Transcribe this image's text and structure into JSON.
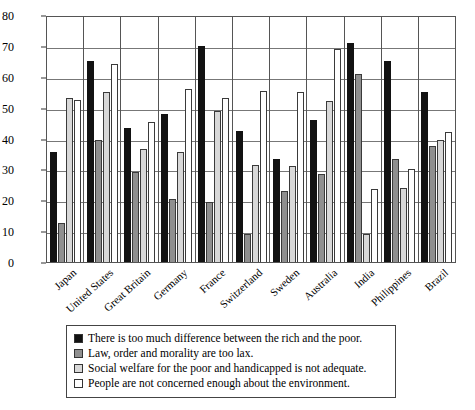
{
  "chart_data": {
    "type": "bar",
    "title": "",
    "subtitle": "",
    "xlabel": "",
    "ylabel": "",
    "ylim": [
      0,
      80
    ],
    "yticks": [
      0,
      10,
      20,
      30,
      40,
      50,
      60,
      70,
      80
    ],
    "grid": true,
    "legend_position": "below-plot",
    "categories": [
      "Japan",
      "United States",
      "Great Britain",
      "Germany",
      "France",
      "Switzerland",
      "Sweden",
      "Australia",
      "India",
      "Philippines",
      "Brazil"
    ],
    "series": [
      {
        "name": "There is too much difference between the rich and the poor.",
        "color": "#121212",
        "values": [
          35.5,
          65,
          43.5,
          48,
          70,
          42.5,
          33.5,
          46,
          71,
          65,
          55
        ]
      },
      {
        "name": "Law, order and morality are too lax.",
        "color": "#8f8f8f",
        "values": [
          12.5,
          39.5,
          29,
          20.5,
          19.5,
          9,
          23,
          28.5,
          61,
          33.5,
          37.5
        ]
      },
      {
        "name": "Social welfare for the poor and handicapped is not adequate.",
        "color": "#d8d8d8",
        "values": [
          53,
          55,
          36.5,
          35.5,
          49,
          31.5,
          31,
          52,
          9,
          24,
          39.5
        ]
      },
      {
        "name": "People are not concerned enough about the environment.",
        "color": "#ffffff",
        "values": [
          52.5,
          64,
          45.5,
          56,
          53,
          55.5,
          55,
          69,
          23.5,
          30,
          42
        ]
      }
    ]
  },
  "legend": {
    "items": [
      {
        "swatch": "series-0-swatch",
        "label": "There is too much difference between the rich and the poor."
      },
      {
        "swatch": "series-1-swatch",
        "label": "Law, order and morality are too lax."
      },
      {
        "swatch": "series-2-swatch",
        "label": "Social welfare for the poor and handicapped is not adequate."
      },
      {
        "swatch": "series-3-swatch",
        "label": "People are not concerned enough about the environment."
      }
    ]
  }
}
